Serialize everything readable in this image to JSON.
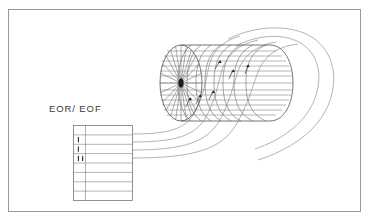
{
  "figure": {
    "background_color": "#ffffff",
    "ink_color": "#6d6d6d",
    "frame": {
      "name": "figure-border",
      "x": 8,
      "y": 9,
      "width": 353,
      "height": 203,
      "stroke_color": "#9a9a9a"
    }
  },
  "labels": {
    "buffer_label": "EOR/ EOF"
  },
  "buffer_table": {
    "name": "buffer-block",
    "x": 73,
    "y": 125,
    "width": 60,
    "height": 76,
    "row_count": 8,
    "narrow_column_width": 12,
    "tick_rows": [
      {
        "row": 2,
        "marks": 1
      },
      {
        "row": 3,
        "marks": 1
      },
      {
        "row": 4,
        "marks": 2
      }
    ],
    "stroke_color": "#6e6e6e"
  },
  "drum": {
    "name": "storage-drum",
    "center_face_x": 181,
    "center_face_y": 83,
    "face_rx": 20,
    "face_ry": 38,
    "body_length": 110,
    "spoke_count": 24,
    "track_count": 13,
    "ring_count": 8,
    "hub_color": "#1d1d1d",
    "arrow_count": 6
  },
  "flow_lines": {
    "name": "data-flow-curves",
    "count": 4,
    "description": "curved transfer paths from buffer block to drum surface",
    "stroke_color": "#8a8a8a"
  },
  "sweep_loops": {
    "name": "outer-sweep-curves",
    "count": 2,
    "description": "large loops wrapping around the right end of the drum"
  }
}
